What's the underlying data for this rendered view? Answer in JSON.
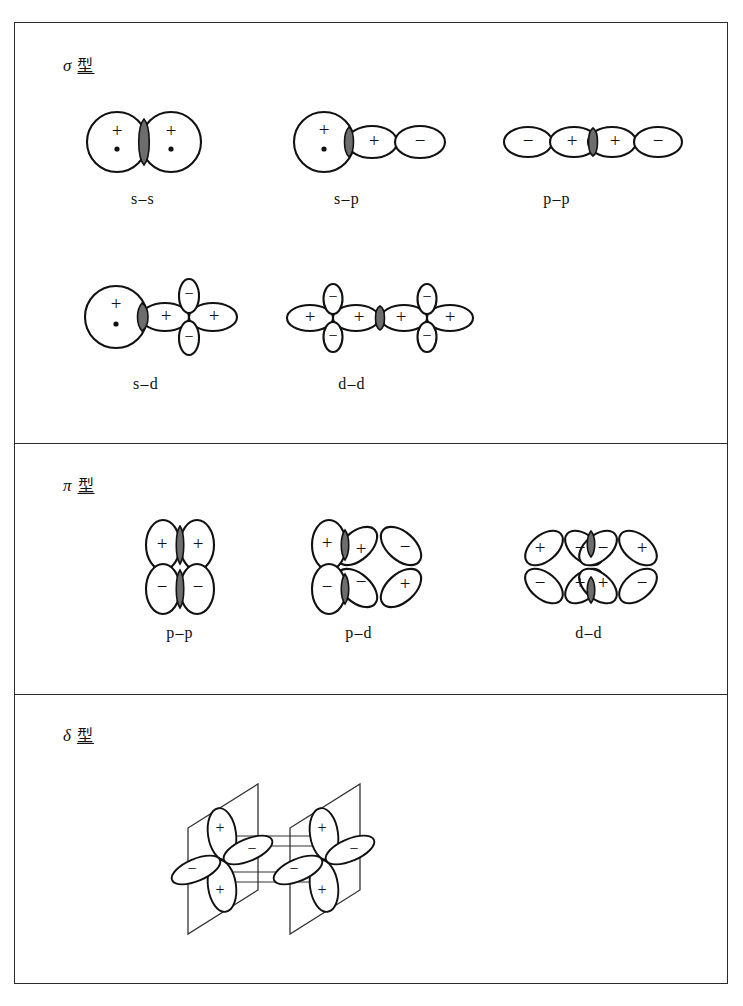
{
  "figure": {
    "outer_border_color": "#2b2b2b",
    "overlap_shade_color": "#6d6d6d",
    "line_color": "#111111"
  },
  "sections": [
    {
      "id": "sigma",
      "symbol": "σ",
      "type_word": "型",
      "label": "σ 型",
      "rows": [
        {
          "items": [
            {
              "caption": "s–s",
              "kind": "s-s"
            },
            {
              "caption": "s–p",
              "kind": "s-p"
            },
            {
              "caption": "p–p",
              "kind": "p-p-sigma"
            }
          ]
        },
        {
          "items": [
            {
              "caption": "s–d",
              "kind": "s-d"
            },
            {
              "caption": "d–d",
              "kind": "d-d-sigma"
            }
          ]
        }
      ]
    },
    {
      "id": "pi",
      "symbol": "π",
      "type_word": "型",
      "label": "π 型",
      "rows": [
        {
          "items": [
            {
              "caption": "p–p",
              "kind": "p-p-pi"
            },
            {
              "caption": "p–d",
              "kind": "p-d-pi"
            },
            {
              "caption": "d–d",
              "kind": "d-d-pi"
            }
          ]
        }
      ]
    },
    {
      "id": "delta",
      "symbol": "δ",
      "type_word": "型",
      "label": "δ 型",
      "rows": [
        {
          "items": [
            {
              "caption": "",
              "kind": "d-d-delta"
            }
          ]
        }
      ]
    }
  ],
  "signs": {
    "plus": "+",
    "minus": "−"
  },
  "captions": {
    "sigma_ss": "s–s",
    "sigma_sp": "s–p",
    "sigma_pp": "p–p",
    "sigma_sd": "s–d",
    "sigma_dd": "d–d",
    "pi_pp": "p–p",
    "pi_pd": "p–d",
    "pi_dd": "d–d"
  },
  "sign_labels": {
    "sigma_ss": [
      "+",
      "+"
    ],
    "sigma_sp": [
      "+",
      "+",
      "−"
    ],
    "sigma_pp": [
      "−",
      "+",
      "+",
      "−"
    ],
    "sigma_sd": [
      "+",
      "+",
      "−",
      "−",
      "+"
    ],
    "sigma_dd": [
      "+",
      "−",
      "−",
      "+",
      "+",
      "−",
      "−",
      "+"
    ],
    "pi_pp": [
      "+",
      "+",
      "−",
      "−"
    ],
    "pi_pd": [
      "+",
      "−",
      "+",
      "−",
      "−",
      "+"
    ],
    "pi_dd": [
      "+",
      "−",
      "−",
      "+",
      "−",
      "+",
      "+",
      "−"
    ],
    "delta_dd": [
      "+",
      "−",
      "−",
      "+",
      "+",
      "−",
      "−",
      "+"
    ]
  }
}
